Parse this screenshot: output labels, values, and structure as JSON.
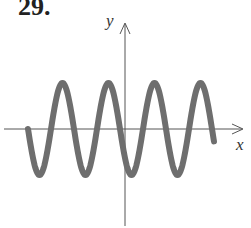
{
  "problem_label": "29.",
  "chart_data": {
    "type": "line",
    "title": "",
    "xlabel": "x",
    "ylabel": "y",
    "grid": false,
    "legend": null,
    "ticks": "none",
    "series": [
      {
        "name": "curve",
        "color": "#6e6e6e",
        "shape": "sine",
        "amplitude_px": 46,
        "period_px": 46,
        "start_x_px": 28,
        "end_x_px": 214,
        "maxima_x_px": [
          63,
          109,
          155,
          201
        ],
        "minima_x_px": [
          40,
          86,
          132,
          178
        ]
      }
    ],
    "axes": {
      "x_axis_y_px": 129,
      "y_axis_x_px": 125,
      "color": "#555555"
    }
  }
}
